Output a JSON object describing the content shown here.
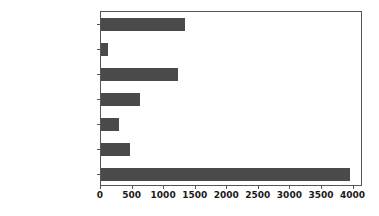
{
  "chart_data": {
    "type": "bar",
    "orientation": "horizontal",
    "title": "",
    "xlabel": "",
    "ylabel": "",
    "categories": [
      "Compact",
      "Mini",
      "Small",
      "Medium",
      "Large / Medium",
      "Large",
      "#na#"
    ],
    "values": [
      1330,
      110,
      1220,
      620,
      285,
      465,
      3940
    ],
    "xlim": [
      0,
      4150
    ],
    "xticks": [
      0,
      500,
      1000,
      1500,
      2000,
      2500,
      3000,
      3500,
      4000
    ],
    "xticklabels": [
      "0",
      "500",
      "1000",
      "1500",
      "2000",
      "2500",
      "3000",
      "3500",
      "4000"
    ],
    "grid": false,
    "legend": null,
    "bar_color": "#4a4a4a",
    "axes_color": "#555555",
    "background_color": "#ffffff"
  }
}
